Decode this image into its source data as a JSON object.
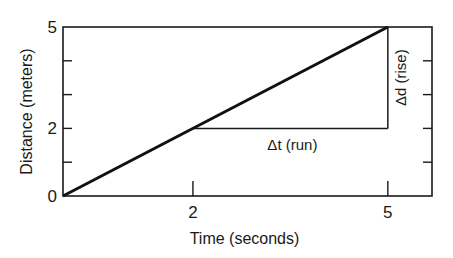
{
  "chart_data": {
    "type": "line",
    "title": "",
    "xlabel": "Time (seconds)",
    "ylabel": "Distance (meters)",
    "xlim": [
      0,
      5.68
    ],
    "ylim": [
      0,
      5
    ],
    "x_ticks": [
      2,
      5
    ],
    "x_tick_labels": [
      "2",
      "5"
    ],
    "y_ticks": [
      0,
      1,
      2,
      3,
      4,
      5
    ],
    "y_tick_labels": [
      "0",
      "",
      "2",
      "",
      "",
      "5"
    ],
    "grid": false,
    "series": [
      {
        "name": "distance",
        "x": [
          0,
          5
        ],
        "y": [
          0,
          5
        ]
      }
    ],
    "annotations": {
      "run": {
        "label": "Δt (run)",
        "from": [
          2,
          2
        ],
        "to": [
          5,
          2
        ]
      },
      "rise": {
        "label": "Δd (rise)",
        "from": [
          5,
          2
        ],
        "to": [
          5,
          5
        ]
      }
    }
  }
}
